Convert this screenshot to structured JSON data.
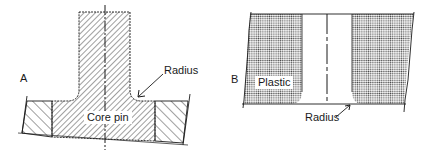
{
  "figure_a": {
    "letter": "A",
    "radius_label": "Radius",
    "core_label": "Core pin"
  },
  "figure_b": {
    "letter": "B",
    "plastic_label": "Plastic",
    "radius_label": "Radius"
  },
  "colors": {
    "line": "#1a1a1a",
    "stipple": "#555555",
    "background": "#ffffff"
  }
}
